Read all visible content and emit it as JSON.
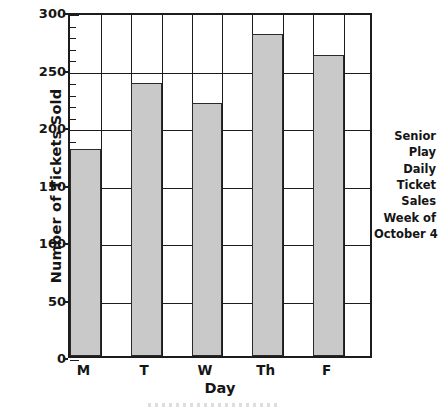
{
  "chart_data": {
    "type": "bar",
    "title": "",
    "categories": [
      "M",
      "T",
      "W",
      "Th",
      "F"
    ],
    "values": [
      180,
      237,
      220,
      280,
      262
    ],
    "series": [
      {
        "name": "Number of Tickets Sold",
        "values": [
          180,
          237,
          220,
          280,
          262
        ]
      }
    ],
    "xlabel": "Day",
    "ylabel": "Number of Tickets Sold",
    "ylim": [
      0,
      300
    ],
    "xlim_categories": 5,
    "y_major_ticks": [
      0,
      50,
      100,
      150,
      200,
      250,
      300
    ],
    "y_tick_labels": [
      "0",
      "50",
      "100",
      "150",
      "200",
      "250",
      "300"
    ],
    "y_minor_tick_step": 10,
    "grid": "horizontal-and-vertical",
    "legend": "none",
    "bar_fill_color": "#c9c9c9",
    "bar_edge_color": "#2a2a2a",
    "axis_color": "#1c1c1c",
    "background_color": "#ffffff",
    "annotation_lines": [
      "Senior",
      "Play",
      "Daily",
      "Ticket",
      "Sales",
      "Week of",
      "October 4"
    ]
  },
  "axes": {
    "y_title": "Number of Tickets Sold",
    "x_title": "Day",
    "y_ticks": [
      {
        "label": "300",
        "value": 300
      },
      {
        "label": "250",
        "value": 250
      },
      {
        "label": "200",
        "value": 200
      },
      {
        "label": "150",
        "value": 150
      },
      {
        "label": "100",
        "value": 100
      },
      {
        "label": "50",
        "value": 50
      },
      {
        "label": "0",
        "value": 0
      }
    ],
    "x_ticks": [
      {
        "label": "M"
      },
      {
        "label": "T"
      },
      {
        "label": "W"
      },
      {
        "label": "Th"
      },
      {
        "label": "F"
      }
    ]
  },
  "caption": {
    "line1": "Senior",
    "line2": "Play",
    "line3": "Daily",
    "line4": "Ticket",
    "line5": "Sales",
    "line6": "Week of",
    "line7": "October 4"
  }
}
